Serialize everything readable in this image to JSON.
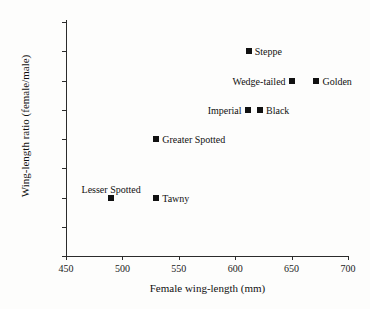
{
  "chart_data": {
    "type": "scatter",
    "title": "",
    "xlabel": "Female wing-length (mm)",
    "ylabel": "Wing-length ratio (female/male)",
    "xlim": [
      450,
      700
    ],
    "ylim": [
      1.02,
      1.1
    ],
    "xticks": [
      450,
      500,
      550,
      600,
      650,
      700
    ],
    "xtick_labels": [
      "450",
      "500",
      "550",
      "600",
      "650",
      "700"
    ],
    "yticks": [
      1.02,
      1.03,
      1.04,
      1.05,
      1.06,
      1.07,
      1.08,
      1.09,
      1.1
    ],
    "ytick_labels": [
      "1.02",
      "1.03",
      "1.04",
      "1.05",
      "1.06",
      "1.07",
      "1.08",
      "1.09",
      "1.10"
    ],
    "grid": false,
    "legend": "none",
    "marker": "square",
    "marker_color": "#111111",
    "points": [
      {
        "label": "Steppe",
        "x": 612,
        "y": 1.09,
        "label_pos": "right"
      },
      {
        "label": "Wedge-tailed",
        "x": 650,
        "y": 1.08,
        "label_pos": "left"
      },
      {
        "label": "Golden",
        "x": 672,
        "y": 1.08,
        "label_pos": "right"
      },
      {
        "label": "Imperial",
        "x": 611,
        "y": 1.07,
        "label_pos": "left"
      },
      {
        "label": "Black",
        "x": 622,
        "y": 1.07,
        "label_pos": "right"
      },
      {
        "label": "Greater Spotted",
        "x": 530,
        "y": 1.06,
        "label_pos": "right"
      },
      {
        "label": "Lesser Spotted",
        "x": 490,
        "y": 1.04,
        "label_pos": "above"
      },
      {
        "label": "Tawny",
        "x": 530,
        "y": 1.04,
        "label_pos": "right"
      }
    ]
  }
}
